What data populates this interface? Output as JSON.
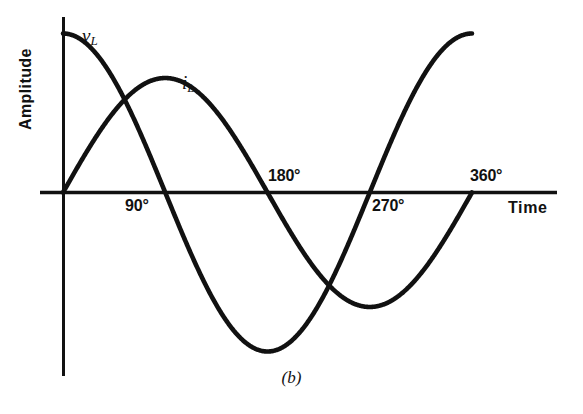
{
  "figure": {
    "caption": "(b)",
    "y_axis_title": "Amplitude",
    "x_axis_title": "Time"
  },
  "labels": {
    "v_curve_symbol": "v",
    "v_curve_subscript": "L",
    "i_curve_symbol": "i",
    "i_curve_subscript": "L"
  },
  "chart_data": {
    "type": "line",
    "title": "(b)",
    "xlabel": "Time",
    "ylabel": "Amplitude",
    "grid": false,
    "legend": "inline-curve-labels",
    "x_tick_labels": [
      "90°",
      "180°",
      "270°",
      "360°"
    ],
    "x_tick_values": [
      90,
      180,
      270,
      360
    ],
    "x": [
      0,
      15,
      30,
      45,
      60,
      75,
      90,
      105,
      120,
      135,
      150,
      165,
      180,
      195,
      210,
      225,
      240,
      255,
      270,
      285,
      300,
      315,
      330,
      345,
      360
    ],
    "xlim": [
      0,
      390
    ],
    "ylim": [
      -1.1,
      1.1
    ],
    "series": [
      {
        "name": "v_L",
        "label": "vL",
        "description": "Inductor voltage, cosine wave leading current by 90 degrees",
        "amplitude": 1.0,
        "phase_deg": 90,
        "color": "#111111",
        "values": [
          1.0,
          0.966,
          0.866,
          0.707,
          0.5,
          0.259,
          0.0,
          -0.259,
          -0.5,
          -0.707,
          -0.866,
          -0.966,
          -1.0,
          -0.966,
          -0.866,
          -0.707,
          -0.5,
          -0.259,
          0.0,
          0.259,
          0.5,
          0.707,
          0.866,
          0.966,
          1.0
        ]
      },
      {
        "name": "i_L",
        "label": "iL",
        "description": "Inductor current, sine wave lagging voltage by 90 degrees",
        "amplitude": 0.72,
        "phase_deg": 0,
        "color": "#111111",
        "values": [
          0.0,
          0.186,
          0.36,
          0.509,
          0.623,
          0.695,
          0.72,
          0.695,
          0.623,
          0.509,
          0.36,
          0.186,
          0.0,
          -0.186,
          -0.36,
          -0.509,
          -0.623,
          -0.695,
          -0.72,
          -0.695,
          -0.623,
          -0.509,
          -0.36,
          -0.186,
          0.0
        ]
      }
    ],
    "annotations": [
      {
        "text": "90°",
        "x": 90,
        "position": "below-axis"
      },
      {
        "text": "180°",
        "x": 180,
        "position": "above-axis"
      },
      {
        "text": "270°",
        "x": 270,
        "position": "below-axis"
      },
      {
        "text": "360°",
        "x": 360,
        "position": "above-axis"
      }
    ]
  },
  "ticks": {
    "deg90": "90°",
    "deg180": "180°",
    "deg270": "270°",
    "deg360": "360°"
  }
}
